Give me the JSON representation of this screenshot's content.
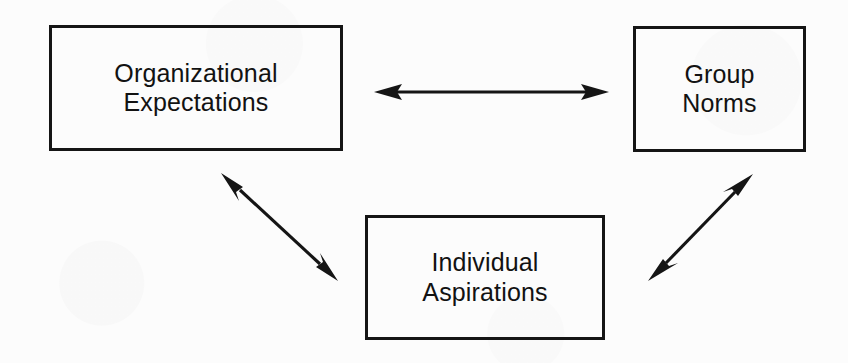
{
  "figure": {
    "type": "relationship-diagram",
    "title": "",
    "background_color": "#fcfcfc",
    "ink_color": "#151515"
  },
  "nodes": [
    {
      "id": "organizational-expectations",
      "label": "Organizational\nExpectations",
      "line1": "Organizational",
      "line2": "Expectations",
      "position": "top-left"
    },
    {
      "id": "group-norms",
      "label": "Group\nNorms",
      "line1": "Group",
      "line2": "Norms",
      "position": "top-right"
    },
    {
      "id": "individual-aspirations",
      "label": "Individual\nAspirations",
      "line1": "Individual",
      "line2": "Aspirations",
      "position": "bottom-center"
    }
  ],
  "connectors": [
    {
      "id": "org-expectations-to-group-norms",
      "from": "organizational-expectations",
      "to": "group-norms",
      "style": "double-headed-arrow",
      "orientation": "horizontal"
    },
    {
      "id": "org-expectations-to-individual-aspirations",
      "from": "organizational-expectations",
      "to": "individual-aspirations",
      "style": "double-headed-arrow",
      "orientation": "diagonal-down-right"
    },
    {
      "id": "group-norms-to-individual-aspirations",
      "from": "group-norms",
      "to": "individual-aspirations",
      "style": "double-headed-arrow",
      "orientation": "diagonal-down-left"
    }
  ]
}
